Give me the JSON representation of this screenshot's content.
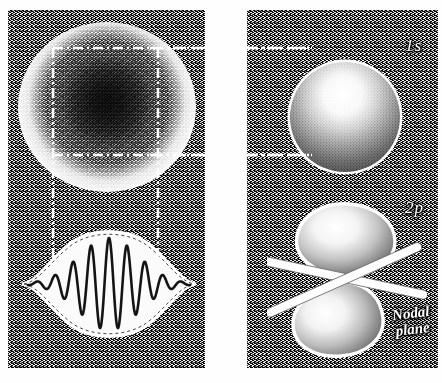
{
  "figure": {
    "domain": "scientific-illustration",
    "background_color": "#ffffff",
    "panel_texture_color": "#4a4a4a",
    "ink_color": "#111111",
    "highlight_color": "#ffffff"
  },
  "panels": {
    "left": {
      "name": "left-panel",
      "x": 8,
      "y": 10,
      "width": 197,
      "height": 358,
      "contents": [
        "electron-probability-cloud",
        "wave-packet"
      ]
    },
    "right": {
      "name": "right-panel",
      "x": 247,
      "y": 10,
      "width": 191,
      "height": 358,
      "contents": [
        "1s-orbital-sphere",
        "2p-orbital-dumbbell",
        "nodal-plane"
      ]
    }
  },
  "labels": {
    "one_s": "1s",
    "two_p": "2p",
    "nodal_plane_line1": "Nodal",
    "nodal_plane_line2": "plane"
  },
  "chart_data": {
    "type": "line",
    "xlabel": "",
    "ylabel": "",
    "grid": false,
    "legend": "none",
    "xlim": [
      0,
      1
    ],
    "ylim": [
      -1,
      1
    ],
    "envelope": {
      "name": "gaussian-envelope",
      "style": "dashed",
      "peak_amplitude": 1.0,
      "center": 0.5,
      "width": 0.26
    },
    "series": [
      {
        "name": "oscillating-wave",
        "cycles": 9,
        "color": "#111111",
        "values": [
          0.0,
          0.04,
          -0.05,
          0.08,
          -0.12,
          0.18,
          -0.26,
          0.36,
          -0.48,
          0.62,
          -0.76,
          0.88,
          -0.96,
          1.0,
          -0.98,
          0.92,
          -0.8,
          0.64,
          -0.46,
          0.3,
          -0.18,
          0.1,
          -0.05,
          0.02,
          0.0
        ]
      }
    ]
  },
  "orbitals": [
    {
      "name": "electron-probability-cloud",
      "representation": "stippled probability density",
      "shape": "spherical",
      "center_density": "maximum",
      "edge_density": "fading to zero"
    },
    {
      "name": "1s-orbital-sphere",
      "representation": "shaded solid sphere",
      "shape": "sphere",
      "nodes": 0
    },
    {
      "name": "2p-orbital-dumbbell",
      "representation": "shaded solid dumbbell",
      "shape": "two-lobed dumbbell",
      "nodes": 1,
      "node_type": "planar"
    }
  ],
  "connectors": [
    {
      "name": "upper-horizontal-connector",
      "style": "dash-dot",
      "y": 48
    },
    {
      "name": "lower-horizontal-connector",
      "style": "dash-dot",
      "y": 155
    },
    {
      "name": "left-vertical-connector",
      "style": "dash-dot",
      "x": 53
    },
    {
      "name": "right-vertical-connector",
      "style": "dash-dot",
      "x": 158
    }
  ]
}
